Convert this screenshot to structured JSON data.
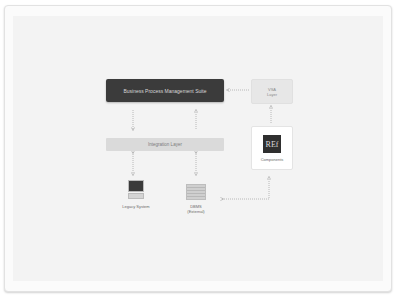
{
  "diagram": {
    "nodes": {
      "bpms": {
        "label": "Business Process Management Suite"
      },
      "vsa": {
        "line1": "VSA",
        "line2": "Layer"
      },
      "integration": {
        "label": "Integration Layer"
      },
      "components": {
        "logo_text": "REf",
        "label": "Components"
      },
      "legacy": {
        "label": "Legacy System"
      },
      "dbms": {
        "line1": "DBMS",
        "line2": "(External)"
      }
    },
    "edges": [
      {
        "from": "vsa",
        "to": "bpms",
        "style": "dotted",
        "direction": "forward"
      },
      {
        "from": "components",
        "to": "vsa",
        "style": "dotted",
        "direction": "forward"
      },
      {
        "from": "bpms",
        "to": "integration",
        "style": "dotted",
        "direction": "forward"
      },
      {
        "from": "integration",
        "to": "bpms",
        "style": "dotted",
        "direction": "forward"
      },
      {
        "from": "integration",
        "to": "legacy",
        "style": "dotted",
        "direction": "both"
      },
      {
        "from": "integration",
        "to": "dbms",
        "style": "dotted",
        "direction": "both"
      },
      {
        "from": "dbms",
        "to": "components",
        "style": "dotted",
        "direction": "both"
      }
    ],
    "colors": {
      "dark_node": "#3b3b3b",
      "light_node": "#e7e7e7",
      "arrow": "#a8a8a8"
    }
  }
}
